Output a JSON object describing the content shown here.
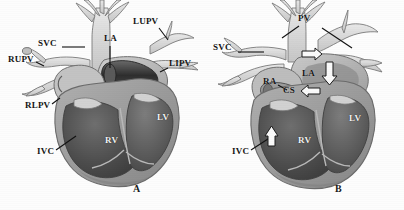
{
  "figure": {
    "type": "medical-illustration",
    "style": "grayscale halftone line drawing"
  },
  "panels": [
    {
      "id": "A",
      "letter": "A",
      "letter_pos": {
        "x": 134,
        "y": 188
      },
      "labels": [
        {
          "name": "svc",
          "text": "SVC",
          "x": 38,
          "y": 44,
          "leader": {
            "x1": 62,
            "y1": 47,
            "x2": 85,
            "y2": 47
          }
        },
        {
          "name": "la",
          "text": "LA",
          "x": 104,
          "y": 39,
          "leader": {
            "x1": 110,
            "y1": 46,
            "x2": 110,
            "y2": 68
          }
        },
        {
          "name": "lupv",
          "text": "LUPV",
          "x": 133,
          "y": 22,
          "leader": {
            "x1": 159,
            "y1": 28,
            "x2": 168,
            "y2": 40
          }
        },
        {
          "name": "rupv",
          "text": "RUPV",
          "x": 10,
          "y": 60,
          "leader": {
            "x1": 36,
            "y1": 62,
            "x2": 44,
            "y2": 66
          }
        },
        {
          "name": "lipv",
          "text": "LIPV",
          "x": 170,
          "y": 64,
          "leader": {
            "x1": 168,
            "y1": 68,
            "x2": 160,
            "y2": 72
          }
        },
        {
          "name": "rlpv",
          "text": "RLPV",
          "x": 25,
          "y": 106,
          "leader": {
            "x1": 52,
            "y1": 104,
            "x2": 60,
            "y2": 98
          }
        },
        {
          "name": "ivc",
          "text": "IVC",
          "x": 37,
          "y": 152,
          "leader": {
            "x1": 56,
            "y1": 150,
            "x2": 76,
            "y2": 136
          }
        },
        {
          "name": "rv",
          "text": "RV",
          "x": 108,
          "y": 141,
          "leader": null
        },
        {
          "name": "lv",
          "text": "LV",
          "x": 159,
          "y": 118,
          "leader": null
        }
      ]
    },
    {
      "id": "B",
      "letter": "B",
      "letter_pos": {
        "x": 334,
        "y": 188
      },
      "labels": [
        {
          "name": "pv",
          "text": "PV",
          "x": 300,
          "y": 19,
          "leader": {
            "x1": 299,
            "y1": 26,
            "x2": 282,
            "y2": 38
          }
        },
        {
          "name": "svc",
          "text": "SVC",
          "x": 213,
          "y": 48,
          "leader": {
            "x1": 238,
            "y1": 52,
            "x2": 264,
            "y2": 52
          }
        },
        {
          "name": "ra",
          "text": "RA",
          "x": 263,
          "y": 82,
          "leader": {
            "x1": 278,
            "y1": 85,
            "x2": 287,
            "y2": 90
          }
        },
        {
          "name": "la",
          "text": "LA",
          "x": 302,
          "y": 74,
          "leader": null
        },
        {
          "name": "cs",
          "text": "CS",
          "x": 283,
          "y": 91,
          "leader": null
        },
        {
          "name": "ivc",
          "text": "IVC",
          "x": 232,
          "y": 152,
          "leader": {
            "x1": 251,
            "y1": 150,
            "x2": 271,
            "y2": 137
          }
        },
        {
          "name": "rv",
          "text": "RV",
          "x": 298,
          "y": 141,
          "leader": null
        },
        {
          "name": "lv",
          "text": "LV",
          "x": 349,
          "y": 119,
          "leader": null
        }
      ],
      "arrows": [
        {
          "name": "pv-inflow-arrow",
          "x": 313,
          "y": 54,
          "angle": 0,
          "length": 17,
          "width": 7
        },
        {
          "name": "la-descent-arrow",
          "x": 327,
          "y": 73,
          "angle": 90,
          "length": 19,
          "width": 8
        },
        {
          "name": "cs-arrow",
          "x": 309,
          "y": 91,
          "angle": 180,
          "length": 16,
          "width": 6
        },
        {
          "name": "ivc-arrow",
          "x": 272,
          "y": 140,
          "angle": -75,
          "length": 16,
          "width": 7
        }
      ]
    }
  ],
  "colors": {
    "background": "#fdfdfd",
    "vessel_fill": "#d8d8d8",
    "vessel_stroke": "#6e6e6e",
    "atrium_fill": "#b9b9b9",
    "ventricle_dark": "#4a4a4a",
    "ventricle_mid": "#7a7a7a",
    "myocardium": "#9a9a9a",
    "catheter": "#3a3a3a",
    "label_text": "#151515",
    "arrow_fill": "#fafafa",
    "arrow_stroke": "#1c1c1c"
  }
}
